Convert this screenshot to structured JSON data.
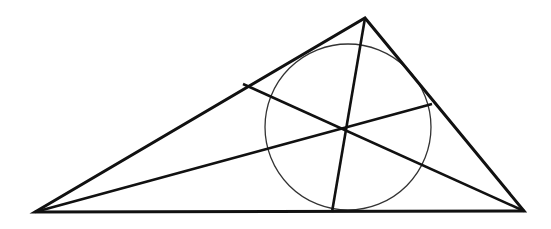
{
  "diagram": {
    "width": 551,
    "height": 229,
    "background": "#ffffff",
    "stroke_color": "#111111",
    "circle_color": "#333333",
    "triangle": {
      "vertices": {
        "left": [
          35,
          212
        ],
        "top": [
          365,
          18
        ],
        "right": [
          524,
          211
        ]
      },
      "stroke_width": 3
    },
    "cevians": [
      {
        "from": "top",
        "from_pt": [
          365,
          18
        ],
        "to_pt": [
          332,
          212
        ]
      },
      {
        "from": "left",
        "from_pt": [
          35,
          212
        ],
        "to_pt": [
          432,
          104
        ]
      },
      {
        "from": "right",
        "from_pt": [
          524,
          211
        ],
        "to_pt": [
          243,
          84
        ]
      }
    ],
    "intersection_point": [
      347,
      127
    ],
    "circle": {
      "cx": 348,
      "cy": 127,
      "r": 83,
      "stroke_width": 1.3
    }
  }
}
